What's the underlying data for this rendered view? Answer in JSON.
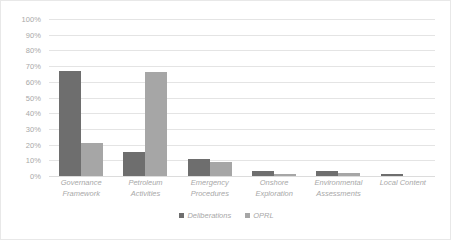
{
  "chart_data": {
    "type": "bar",
    "title": "",
    "subtitle": "",
    "xlabel": "",
    "ylabel": "",
    "ylim": [
      0,
      100
    ],
    "y_tick_labels": [
      "100%",
      "90%",
      "80%",
      "70%",
      "60%",
      "50%",
      "40%",
      "30%",
      "20%",
      "10%",
      "0%"
    ],
    "y_tick_values": [
      100,
      90,
      80,
      70,
      60,
      50,
      40,
      30,
      20,
      10,
      0
    ],
    "grid": true,
    "legend_position": "bottom-center",
    "categories": [
      "Governance Framework",
      "Petroleum Activities",
      "Emergency Procedures",
      "Onshore Exploration",
      "Environmental Assessments",
      "Local Content"
    ],
    "category_lines": [
      [
        "Governance",
        "Framework"
      ],
      [
        "Petroleum",
        "Activities"
      ],
      [
        "Emergency",
        "Procedures"
      ],
      [
        "Onshore",
        "Exploration"
      ],
      [
        "Environmental",
        "Assessments"
      ],
      [
        "Local Content",
        ""
      ]
    ],
    "series": [
      {
        "name": "Deliberations",
        "color": "#6e6e6e",
        "values": [
          67,
          15,
          11,
          3,
          3,
          1
        ]
      },
      {
        "name": "OPRL",
        "color": "#a6a6a6",
        "values": [
          21,
          66,
          9,
          1,
          2,
          0
        ]
      }
    ]
  },
  "colors": {
    "series_1": "#6e6e6e",
    "series_2": "#a6a6a6",
    "gridline": "#e4e4e4",
    "text": "#a8a8a8",
    "border": "#e8e8e8",
    "background": "#ffffff"
  }
}
